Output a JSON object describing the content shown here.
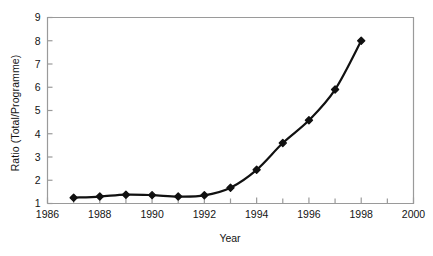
{
  "figure": {
    "title_remnant": "",
    "background_color": "#ffffff",
    "frame_color": "#9a9a9a",
    "series_color": "#111111"
  },
  "chart_data": {
    "type": "line",
    "title": "",
    "xlabel": "Year",
    "ylabel": "Ratio (Total/Programme)",
    "x": [
      1987,
      1988,
      1989,
      1990,
      1991,
      1992,
      1993,
      1994,
      1995,
      1996,
      1997,
      1998
    ],
    "values": [
      1.25,
      1.3,
      1.38,
      1.36,
      1.3,
      1.35,
      1.68,
      2.45,
      3.6,
      4.58,
      5.9,
      8.0
    ],
    "series": [
      {
        "name": "Ratio (Total/Programme)",
        "values": [
          1.25,
          1.3,
          1.38,
          1.36,
          1.3,
          1.35,
          1.68,
          2.45,
          3.6,
          4.58,
          5.9,
          8.0
        ]
      }
    ],
    "xlim": [
      1986,
      2000
    ],
    "ylim": [
      1,
      9
    ],
    "xticks": [
      1986,
      1988,
      1990,
      1992,
      1994,
      1996,
      1998,
      2000
    ],
    "xtick_labels": [
      "1986",
      "1988",
      "1990",
      "1992",
      "1994",
      "1996",
      "1998",
      "2000"
    ],
    "yticks": [
      1,
      2,
      3,
      4,
      5,
      6,
      7,
      8,
      9
    ],
    "ytick_labels": [
      "1",
      "2",
      "3",
      "4",
      "5",
      "6",
      "7",
      "8",
      "9"
    ],
    "minor_xticks": [
      1987,
      1989,
      1991,
      1993,
      1995,
      1997,
      1999
    ],
    "grid": false,
    "legend": false,
    "marker": "diamond",
    "line_width": 2.2
  }
}
